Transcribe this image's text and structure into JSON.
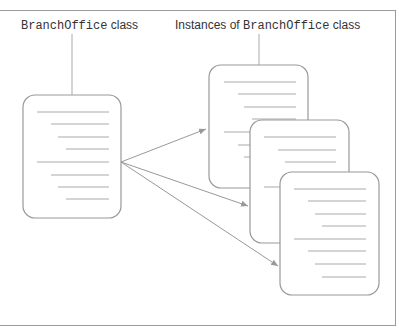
{
  "diagram": {
    "class_label": {
      "code": "BranchOffice",
      "suffix": " class"
    },
    "instances_label": {
      "prefix": "Instances of ",
      "code": "BranchOffice",
      "suffix": " class"
    },
    "colors": {
      "border": "#9a9a9a",
      "line": "#a8a8a8",
      "arrow": "#999999",
      "text": "#333333"
    },
    "nodes": [
      {
        "id": "class-document",
        "kind": "class"
      },
      {
        "id": "instance-1",
        "kind": "instance"
      },
      {
        "id": "instance-2",
        "kind": "instance"
      },
      {
        "id": "instance-3",
        "kind": "instance"
      }
    ],
    "edges": [
      {
        "from": "class-document",
        "to": "instance-1"
      },
      {
        "from": "class-document",
        "to": "instance-2"
      },
      {
        "from": "class-document",
        "to": "instance-3"
      }
    ]
  }
}
